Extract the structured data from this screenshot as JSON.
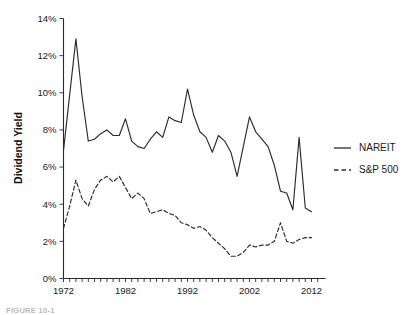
{
  "figure": {
    "caption_partial": "FIGURE 10-1"
  },
  "chart_data": {
    "type": "line",
    "title": "",
    "xlabel": "",
    "ylabel": "Dividend Yield",
    "xlim": [
      1972,
      2012
    ],
    "ylim": [
      0,
      14
    ],
    "y_unit": "%",
    "grid": false,
    "legend_position": "right",
    "y_ticks": [
      0,
      2,
      4,
      6,
      8,
      10,
      12,
      14
    ],
    "y_tick_labels": [
      "0%",
      "2%",
      "4%",
      "6%",
      "8%",
      "10%",
      "12%",
      "14%"
    ],
    "x_ticks": [
      1972,
      1982,
      1992,
      2002,
      2012
    ],
    "x_tick_labels": [
      "1972",
      "1982",
      "1992",
      "2002",
      "2012"
    ],
    "x_minor_tick_step": 1,
    "x": [
      1972,
      1973,
      1974,
      1975,
      1976,
      1977,
      1978,
      1979,
      1980,
      1981,
      1982,
      1983,
      1984,
      1985,
      1986,
      1987,
      1988,
      1989,
      1990,
      1991,
      1992,
      1993,
      1994,
      1995,
      1996,
      1997,
      1998,
      1999,
      2000,
      2001,
      2002,
      2003,
      2004,
      2005,
      2006,
      2007,
      2008,
      2009,
      2010,
      2011,
      2012
    ],
    "series": [
      {
        "name": "NAREIT",
        "style": "solid",
        "color": "#2b2b2b",
        "values": [
          6.9,
          9.9,
          12.9,
          9.8,
          7.4,
          7.5,
          7.8,
          8.0,
          7.7,
          7.7,
          8.6,
          7.4,
          7.1,
          7.0,
          7.5,
          7.9,
          7.6,
          8.7,
          8.5,
          8.4,
          10.2,
          8.8,
          7.9,
          7.6,
          6.8,
          7.7,
          7.4,
          6.8,
          5.5,
          7.1,
          8.7,
          7.9,
          7.5,
          7.1,
          6.1,
          4.7,
          4.6,
          3.7,
          7.6,
          3.8,
          3.6
        ]
      },
      {
        "name": "S&P 500",
        "style": "dashed",
        "color": "#2b2b2b",
        "values": [
          2.7,
          3.9,
          5.3,
          4.3,
          3.9,
          4.8,
          5.3,
          5.5,
          5.2,
          5.5,
          4.9,
          4.3,
          4.6,
          4.3,
          3.5,
          3.6,
          3.7,
          3.5,
          3.4,
          3.0,
          2.9,
          2.7,
          2.8,
          2.6,
          2.2,
          1.9,
          1.6,
          1.2,
          1.2,
          1.4,
          1.8,
          1.7,
          1.8,
          1.8,
          2.0,
          3.0,
          2.0,
          1.9,
          2.1,
          2.2,
          2.2
        ]
      }
    ],
    "legend": [
      {
        "label": "NAREIT",
        "style": "solid"
      },
      {
        "label": "S&P 500",
        "style": "dashed"
      }
    ]
  }
}
